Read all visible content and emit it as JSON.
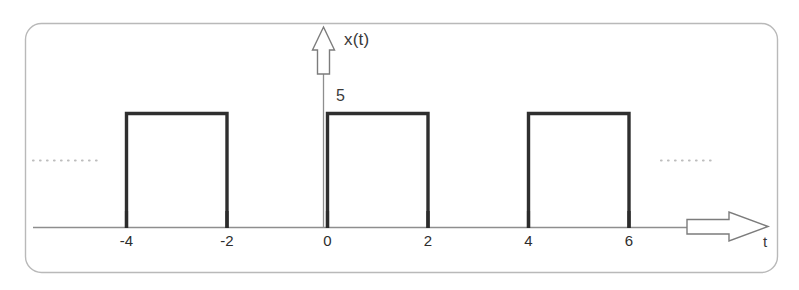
{
  "figure": {
    "signal_label": "x(t)",
    "amplitude_label": "5",
    "time_axis_label": "t",
    "left_ellipsis": "……………",
    "right_ellipsis": "…………",
    "colors": {
      "pulse_stroke": "#2f2f2f",
      "axis": "#8e8e8e",
      "frame": "#b9b9b9",
      "tick": "#2b2b2b",
      "ellipsis": "#bdbdbd",
      "arrow_fill": "#ffffff",
      "arrow_stroke": "#7c7c7c",
      "background": "#ffffff"
    },
    "tick_labels": [
      "-4",
      "-2",
      "0",
      "2",
      "4",
      "6"
    ]
  },
  "chart_data": {
    "type": "line",
    "title": "",
    "subtitle": "",
    "xlabel": "t",
    "ylabel": "x(t)",
    "xlim": [
      -5.6,
      8.8
    ],
    "ylim": [
      0,
      6.2
    ],
    "grid": false,
    "legend": null,
    "x_ticks": [
      -4,
      -2,
      0,
      2,
      4,
      6
    ],
    "x_tick_labels": [
      "-4",
      "-2",
      "0",
      "2",
      "4",
      "6"
    ],
    "y_ticks": [
      5
    ],
    "y_tick_labels": [
      "5"
    ],
    "amplitude": 5,
    "pulse_width": 2,
    "period": 4,
    "duty_cycle": 0.5,
    "pulses": [
      {
        "start": -4,
        "end": -2,
        "height": 5
      },
      {
        "start": 0,
        "end": 2,
        "height": 5
      },
      {
        "start": 4,
        "end": 6,
        "height": 5
      }
    ],
    "series": [
      {
        "name": "x(t)",
        "x": [
          -5.6,
          -4,
          -4,
          -2,
          -2,
          0,
          0,
          2,
          2,
          4,
          4,
          6,
          6,
          8.2
        ],
        "values": [
          0,
          0,
          5,
          5,
          0,
          0,
          5,
          5,
          0,
          0,
          5,
          5,
          0,
          0
        ]
      }
    ],
    "annotations": [
      {
        "text": "x(t)",
        "role": "y-axis-label"
      },
      {
        "text": "5",
        "role": "amplitude-value"
      },
      {
        "text": "t",
        "role": "x-axis-label"
      },
      {
        "text": "……………",
        "role": "continuation-left"
      },
      {
        "text": "…………",
        "role": "continuation-right"
      }
    ]
  }
}
